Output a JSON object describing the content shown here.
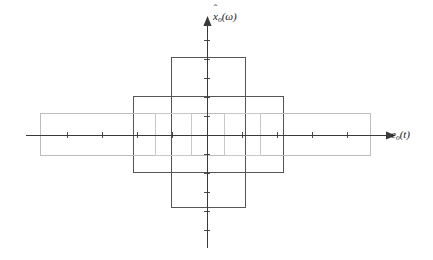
{
  "figure": {
    "type": "cartesian-axes-diagram",
    "background_color": "#ffffff",
    "width": 433,
    "height": 260,
    "origin": {
      "x": 207,
      "y": 135
    },
    "axes": {
      "y_axis": {
        "label_plain": "x̂o(ω)",
        "label_base": "x",
        "label_accent": "^",
        "label_subscript": "o",
        "label_argument": "(ω)",
        "color": "#3a3a3a",
        "x": 207,
        "y_top": 24,
        "y_bottom": 248,
        "arrow": "up",
        "tick_spacing": 19,
        "tick_half_length": 3
      },
      "x_axis": {
        "label_plain": "eo(t)",
        "label_base": "e",
        "label_subscript": "o",
        "label_argument": "(t)",
        "color": "#3a3a3a",
        "y": 135,
        "x_left": 26,
        "x_right": 388,
        "arrow": "right",
        "tick_spacing": 35,
        "tick_half_length": 3
      }
    },
    "rectangles": [
      {
        "name": "tall-narrow-rect",
        "description": "tall narrow vertical rectangle centered on origin",
        "x": 171,
        "y": 57,
        "width": 74,
        "height": 150,
        "stroke": "#555555",
        "stroke_width": 1.1,
        "fill": "none"
      },
      {
        "name": "medium-rect",
        "description": "medium wide rectangle centered on origin",
        "x": 133,
        "y": 96,
        "width": 150,
        "height": 76,
        "stroke": "#555555",
        "stroke_width": 1.1,
        "fill": "none"
      },
      {
        "name": "wide-flat-rect",
        "description": "wide short light grey rectangle centered on origin",
        "x": 40,
        "y": 113,
        "width": 330,
        "height": 42,
        "stroke": "#bdbdbd",
        "stroke_width": 1.1,
        "fill": "none"
      },
      {
        "name": "small-square-left",
        "description": "small light grey square left of the vertical axis",
        "x": 155,
        "y": 113,
        "width": 36,
        "height": 42,
        "stroke": "#c8c8c8",
        "stroke_width": 1.1,
        "fill": "none"
      },
      {
        "name": "small-square-right",
        "description": "small light grey square right of the vertical axis",
        "x": 224,
        "y": 113,
        "width": 36,
        "height": 42,
        "stroke": "#c8c8c8",
        "stroke_width": 1.1,
        "fill": "none"
      }
    ]
  },
  "chart_data": {
    "type": "line",
    "title": "",
    "xlabel": "eo(t)",
    "ylabel": "x̂o(ω)",
    "grid": false,
    "legend": "none",
    "xlim": [
      -5.17,
      5.17
    ],
    "ylim": [
      -5.84,
      5.84
    ],
    "series": [
      {
        "name": "tall-narrow-rect",
        "half_width_x": 1.06,
        "half_height_y": 3.95,
        "x_extent": [
          -1.06,
          1.06
        ],
        "y_extent": [
          -3.95,
          3.95
        ],
        "color": "#555555"
      },
      {
        "name": "medium-rect",
        "half_width_x": 2.14,
        "half_height_y": 2.0,
        "x_extent": [
          -2.14,
          2.14
        ],
        "y_extent": [
          -2.0,
          2.0
        ],
        "color": "#555555"
      },
      {
        "name": "wide-flat-rect",
        "half_width_x": 4.71,
        "half_height_y": 1.11,
        "x_extent": [
          -4.71,
          4.71
        ],
        "y_extent": [
          -1.11,
          1.11
        ],
        "color": "#bdbdbd"
      },
      {
        "name": "small-square-left",
        "half_width_x": 0.51,
        "half_height_y": 1.11,
        "x_extent": [
          -1.49,
          -0.46
        ],
        "y_extent": [
          -1.11,
          1.11
        ],
        "color": "#c8c8c8"
      },
      {
        "name": "small-square-right",
        "half_width_x": 0.51,
        "half_height_y": 1.11,
        "x_extent": [
          0.49,
          1.51
        ],
        "y_extent": [
          -1.11,
          1.11
        ],
        "color": "#c8c8c8"
      }
    ],
    "x_ticks": [
      -5.17,
      -4.17,
      -3.17,
      -2.17,
      -1.17,
      0,
      1.0,
      2.0,
      3.0,
      4.0,
      5.0
    ],
    "y_ticks": [
      -5.84,
      -4.84,
      -3.84,
      -2.84,
      -1.84,
      0,
      1.0,
      2.0,
      3.0,
      4.0,
      5.0
    ],
    "x_tick_labels": [],
    "y_tick_labels": []
  }
}
